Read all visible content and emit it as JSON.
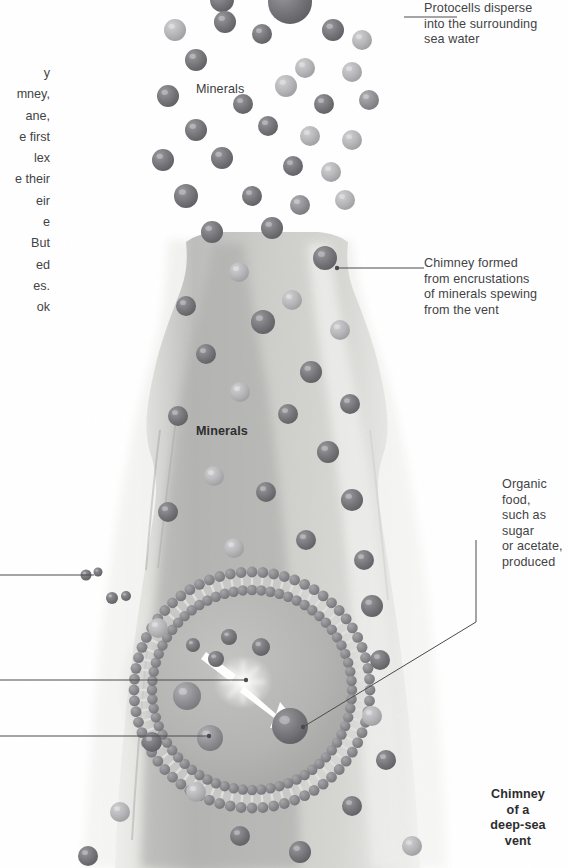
{
  "figure": {
    "background_color": "#ffffff",
    "text_color": "#434346"
  },
  "left_column_text": "y\nmney,\nane,\ne first\nlex\ne their\neir\ne\n But\ned\nes.\nok",
  "inline_labels": {
    "minerals_top": "Minerals",
    "minerals_middle": "Minerals"
  },
  "callouts": {
    "protocells": "Protocells disperse\ninto the surrounding\nsea water",
    "chimney": "Chimney formed\nfrom encrustations\nof minerals spewing\nfrom the vent",
    "organic_food": "Organic food,\nsuch as sugar\nor acetate,\nproduced",
    "vent": "Chimney\nof a\ndeep-sea\nvent"
  },
  "colors": {
    "chimney_light": "#e9e9e7",
    "chimney_mid": "#c9c9c7",
    "chimney_shade": "#a9a9a8",
    "mineral_dark": "#6f6f72",
    "mineral_mid": "#8e8e91",
    "mineral_light": "#b9b9bb",
    "membrane_head": "#8b8b8e",
    "cell_interior": "#b3b3b2",
    "arrow_white": "#ffffff",
    "leader_line": "#4a4a4d"
  },
  "graphic_elements": {
    "mineral_particle_count": 46,
    "membrane_bead_count": 60,
    "white_arrows": 2,
    "leader_lines": 6
  }
}
